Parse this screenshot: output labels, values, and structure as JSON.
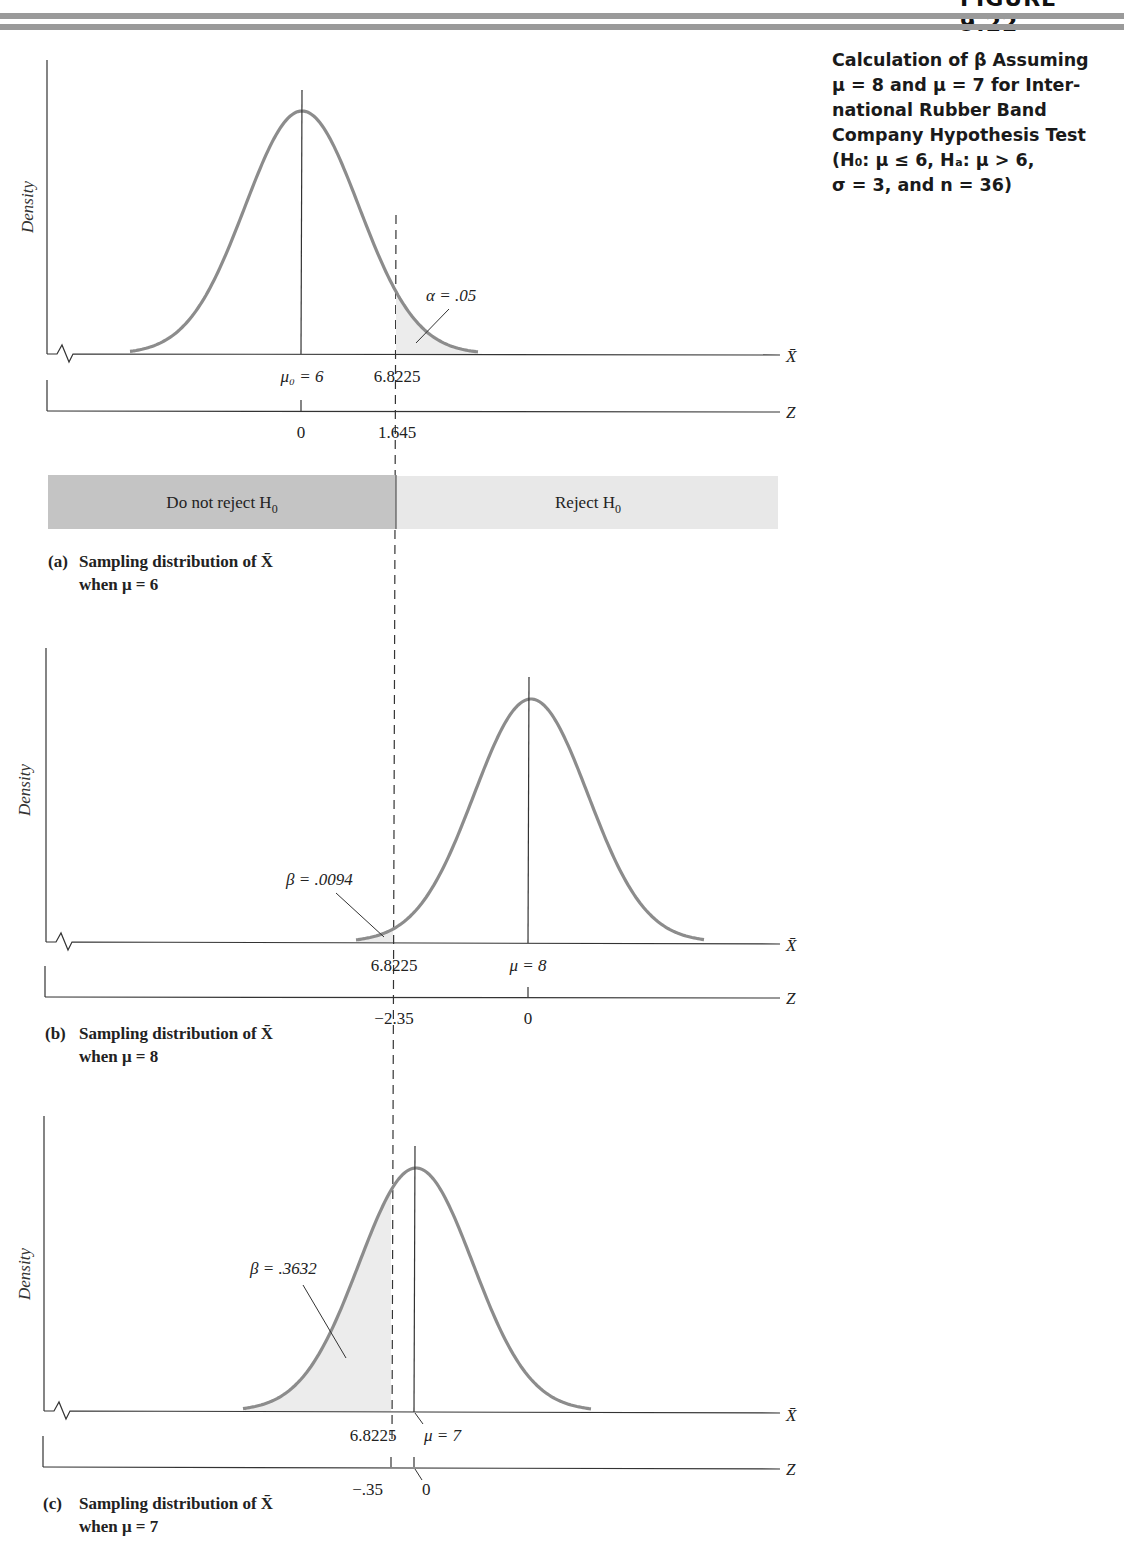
{
  "figure": {
    "heading": "FIGURE 9.22",
    "caption_lines": [
      "Calculation of β Assuming",
      "μ = 8 and μ = 7 for Inter-",
      "national Rubber Band",
      "Company Hypothesis Test",
      "(H₀: μ ≤ 6, Hₐ: μ > 6,",
      "σ = 3, and n = 36)"
    ]
  },
  "common": {
    "density_label": "Density",
    "xbar_axis_label": "X̄",
    "z_axis_label": "Z",
    "critical_value": "6.8225"
  },
  "decision_bar": {
    "do_not_reject": "Do not reject H",
    "reject": "Reject H",
    "subscript": "0",
    "dark_color": "#c4c4c4",
    "light_color": "#e8e8e8"
  },
  "panels": [
    {
      "id": "a",
      "tag": "(a)",
      "title": "Sampling distribution of X̄",
      "subtitle": "when μ = 6",
      "mean_label": "μ₀ = 6",
      "critical_label": "6.8225",
      "z_mean": "0",
      "z_critical": "1.645",
      "area_label": "α = .05"
    },
    {
      "id": "b",
      "tag": "(b)",
      "title": "Sampling distribution of X̄",
      "subtitle": "when μ = 8",
      "mean_label": "μ = 8",
      "critical_label": "6.8225",
      "z_mean": "0",
      "z_critical": "−2.35",
      "area_label": "β = .0094"
    },
    {
      "id": "c",
      "tag": "(c)",
      "title": "Sampling distribution of X̄",
      "subtitle": "when μ = 7",
      "mean_label": "μ = 7",
      "critical_label": "6.8225",
      "z_mean": "0",
      "z_critical": "−.35",
      "area_label": "β = .3632"
    }
  ],
  "chart_data": [
    {
      "type": "area",
      "title": "(a) Sampling distribution of X̄ when μ = 6",
      "xlabel": "X̄ / Z",
      "ylabel": "Density",
      "distribution": "normal",
      "mean": 6,
      "std_error": 0.5,
      "critical_value": 6.8225,
      "z_critical": 1.645,
      "shaded_region": "right of 6.8225",
      "shaded_area": 0.05,
      "shaded_label": "α = .05",
      "regions": [
        "Do not reject H0",
        "Reject H0"
      ]
    },
    {
      "type": "area",
      "title": "(b) Sampling distribution of X̄ when μ = 8",
      "xlabel": "X̄ / Z",
      "ylabel": "Density",
      "distribution": "normal",
      "mean": 8,
      "std_error": 0.5,
      "critical_value": 6.8225,
      "z_critical": -2.35,
      "shaded_region": "left of 6.8225",
      "shaded_area": 0.0094,
      "shaded_label": "β = .0094"
    },
    {
      "type": "area",
      "title": "(c) Sampling distribution of X̄ when μ = 7",
      "xlabel": "X̄ / Z",
      "ylabel": "Density",
      "distribution": "normal",
      "mean": 7,
      "std_error": 0.5,
      "critical_value": 6.8225,
      "z_critical": -0.35,
      "shaded_region": "left of 6.8225",
      "shaded_area": 0.3632,
      "shaded_label": "β = .3632"
    }
  ]
}
